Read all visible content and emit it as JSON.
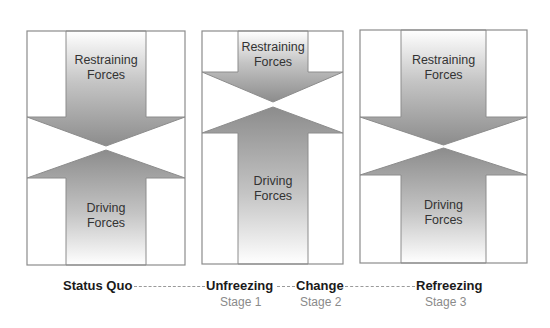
{
  "diagram": {
    "type": "force-field-change-model",
    "colors": {
      "panel_border": "#8c8c8c",
      "arrow_fill_dark": "#8f8f8f",
      "arrow_fill_light": "#ffffff",
      "stage_name": "#1a1a1a",
      "stage_number": "#8a8a8a",
      "connector": "#9a9a9a"
    },
    "panels": [
      {
        "id": "status-quo",
        "restraining_label": [
          "Restraining",
          "Forces"
        ],
        "driving_label": [
          "Driving",
          "Forces"
        ],
        "box": {
          "x": 27,
          "y": 31,
          "w": 158,
          "h": 234
        },
        "shaft": {
          "left": 66,
          "right": 146
        },
        "restraining": {
          "shoulder_y": 117,
          "tip_y": 146
        },
        "driving": {
          "tip_y": 150,
          "shoulder_y": 178
        }
      },
      {
        "id": "change",
        "restraining_label": [
          "Restraining",
          "Forces"
        ],
        "driving_label": [
          "Driving",
          "Forces"
        ],
        "box": {
          "x": 202,
          "y": 31,
          "w": 141,
          "h": 233
        },
        "shaft": {
          "left": 238,
          "right": 308
        },
        "restraining": {
          "shoulder_y": 72,
          "tip_y": 102
        },
        "driving": {
          "tip_y": 107,
          "shoulder_y": 133
        }
      },
      {
        "id": "refreezing",
        "restraining_label": [
          "Restraining",
          "Forces"
        ],
        "driving_label": [
          "Driving",
          "Forces"
        ],
        "box": {
          "x": 360,
          "y": 30,
          "w": 167,
          "h": 233
        },
        "shaft": {
          "left": 401,
          "right": 486
        },
        "restraining": {
          "shoulder_y": 117,
          "tip_y": 145
        },
        "driving": {
          "tip_y": 148,
          "shoulder_y": 175
        }
      }
    ]
  },
  "timeline": {
    "stages": [
      {
        "name": "Status Quo",
        "number": ""
      },
      {
        "name": "Unfreezing",
        "number": "Stage 1"
      },
      {
        "name": "Change",
        "number": "Stage 2"
      },
      {
        "name": "Refreezing",
        "number": "Stage 3"
      }
    ]
  }
}
